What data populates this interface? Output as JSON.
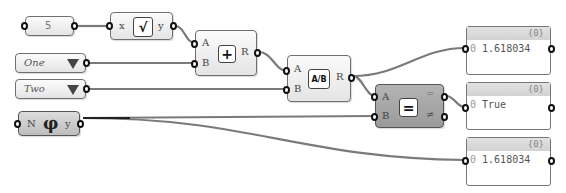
{
  "nodes": {
    "number": {
      "value": "5"
    },
    "sqrt": {
      "input": "x",
      "output": "y",
      "icon": "√"
    },
    "addition": {
      "input_a": "A",
      "input_b": "B",
      "output": "R",
      "icon": "+"
    },
    "value_list_one": {
      "selected": "One"
    },
    "value_list_two": {
      "selected": "Two"
    },
    "division": {
      "input_a": "A",
      "input_b": "B",
      "output": "R",
      "icon": "A/B"
    },
    "golden_ratio": {
      "input": "N",
      "output": "y",
      "icon": "φ"
    },
    "equality": {
      "input_a": "A",
      "input_b": "B",
      "output_eq": "=",
      "output_neq": "≠",
      "icon": "="
    }
  },
  "panels": [
    {
      "path": "{0}",
      "index": "0",
      "value": "1.618034"
    },
    {
      "path": "{0}",
      "index": "0",
      "value": "True"
    },
    {
      "path": "{0}",
      "index": "0",
      "value": "1.618034"
    }
  ],
  "colors": {
    "wire": "#777777",
    "wire_dark": "#222222",
    "node_dark": "#a8a8a8"
  }
}
